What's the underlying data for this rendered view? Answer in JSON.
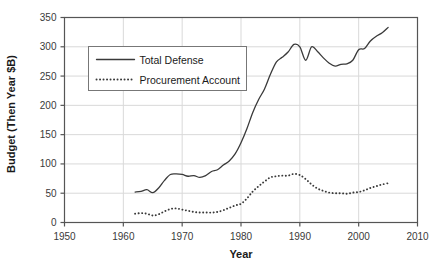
{
  "chart_data": {
    "type": "line",
    "title": "",
    "xlabel": "Year",
    "ylabel": "Budget (Then Year $B)",
    "xlim": [
      1950,
      2010
    ],
    "ylim": [
      0,
      350
    ],
    "xticks": [
      1950,
      1960,
      1970,
      1980,
      1990,
      2000,
      2010
    ],
    "ytick_labels": [
      "0",
      "50",
      "100",
      "150",
      "200",
      "250",
      "300",
      "350"
    ],
    "yticks": [
      0,
      50,
      100,
      150,
      200,
      250,
      300,
      350
    ],
    "grid": true,
    "grid_color": "#d9d9d9",
    "legend_position": "upper-left-inside",
    "x": [
      1962,
      1963,
      1964,
      1965,
      1966,
      1967,
      1968,
      1969,
      1970,
      1971,
      1972,
      1973,
      1974,
      1975,
      1976,
      1977,
      1978,
      1979,
      1980,
      1981,
      1982,
      1983,
      1984,
      1985,
      1986,
      1987,
      1988,
      1989,
      1990,
      1991,
      1992,
      1993,
      1994,
      1995,
      1996,
      1997,
      1998,
      1999,
      2000,
      2001,
      2002,
      2003,
      2004,
      2005
    ],
    "series": [
      {
        "name": "Total Defense",
        "style": "solid",
        "color": "#3a3a3a",
        "values": [
          52,
          53,
          56,
          51,
          59,
          72,
          82,
          83,
          82,
          79,
          80,
          77,
          80,
          87,
          90,
          98,
          105,
          117,
          136,
          160,
          188,
          210,
          228,
          253,
          274,
          282,
          291,
          304,
          300,
          277,
          300,
          292,
          281,
          272,
          267,
          270,
          271,
          277,
          295,
          297,
          310,
          318,
          324,
          333
        ]
      },
      {
        "name": "Procurement Account",
        "style": "dotted",
        "color": "#3a3a3a",
        "values": [
          15,
          16,
          15,
          12,
          14,
          19,
          23,
          24,
          22,
          20,
          18,
          17,
          17,
          17,
          18,
          21,
          25,
          29,
          32,
          41,
          53,
          62,
          70,
          77,
          79,
          80,
          80,
          83,
          81,
          74,
          65,
          58,
          54,
          51,
          50,
          50,
          49,
          51,
          52,
          55,
          59,
          62,
          65,
          67
        ]
      }
    ]
  },
  "legend": {
    "items": [
      {
        "label": "Total Defense",
        "style": "solid"
      },
      {
        "label": "Procurement Account",
        "style": "dotted"
      }
    ]
  }
}
